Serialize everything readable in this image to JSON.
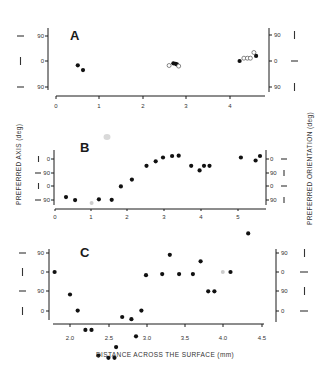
{
  "figure": {
    "y_axis_title_left": "PREFERRED AXIS (deg)",
    "y_axis_title_right": "PREFERRED ORIENTATION (deg)",
    "x_axis_title": "DISTANCE ACROSS THE SURFACE (mm)"
  },
  "chart_data": [
    {
      "panel": "A",
      "type": "scatter",
      "title": "A",
      "xlabel": "",
      "ylabel": "PREFERRED AXIS (deg)",
      "ylabel_right": "PREFERRED ORIENTATION (deg)",
      "x_ticks": [
        "0",
        "1",
        "2",
        "3",
        "4"
      ],
      "y_ticks_left": [
        "90",
        "0",
        "90"
      ],
      "y_ticks_right": [
        "90",
        "0",
        "90"
      ],
      "xlim": [
        -0.2,
        4.9
      ],
      "ylim": [
        -110,
        110
      ],
      "grid": false,
      "series": [
        {
          "name": "filled",
          "marker": "filled-circle",
          "x": [
            0.5,
            0.62,
            2.7,
            2.75,
            2.78,
            4.22,
            4.6
          ],
          "y": [
            -15,
            -32,
            -8,
            -10,
            -12,
            0,
            18
          ]
        },
        {
          "name": "open",
          "marker": "open-circle",
          "x": [
            2.6,
            2.82,
            4.32,
            4.4,
            4.47,
            4.55
          ],
          "y": [
            -16,
            -18,
            10,
            10,
            10,
            30
          ]
        }
      ]
    },
    {
      "panel": "B",
      "type": "scatter",
      "title": "B",
      "xlabel": "",
      "ylabel": "PREFERRED AXIS (deg)",
      "ylabel_right": "PREFERRED ORIENTATION (deg)",
      "x_ticks": [
        "0",
        "1",
        "2",
        "3",
        "4",
        "5"
      ],
      "y_ticks_left": [
        "0",
        "90",
        "0",
        "90"
      ],
      "y_ticks_right": [
        "0",
        "90",
        "0",
        "90"
      ],
      "y_note": "Alternating 0/90 tick labels; values plotted as cumulative angle (deg) increasing upward",
      "xlim": [
        0,
        5.7
      ],
      "ylim": [
        -310,
        40
      ],
      "grid": false,
      "series": [
        {
          "name": "filled",
          "marker": "filled-circle",
          "x": [
            0.3,
            0.55,
            1.2,
            1.55,
            1.8,
            2.1,
            2.5,
            2.75,
            2.95,
            3.2,
            3.38,
            3.72,
            3.95,
            4.07,
            4.22,
            5.08,
            5.48,
            5.6
          ],
          "y": [
            -250,
            -270,
            -265,
            -268,
            -180,
            -135,
            -45,
            -15,
            10,
            20,
            22,
            -45,
            -75,
            -45,
            -45,
            10,
            -10,
            20
          ]
        },
        {
          "name": "grey",
          "marker": "grey-circle",
          "x": [
            1.0
          ],
          "y": [
            -290
          ]
        }
      ]
    },
    {
      "panel": "C",
      "type": "scatter",
      "title": "C",
      "xlabel": "DISTANCE ACROSS THE SURFACE (mm)",
      "ylabel": "PREFERRED AXIS (deg)",
      "ylabel_right": "PREFERRED ORIENTATION (deg)",
      "x_ticks": [
        "2.0",
        "2.5",
        "3.0",
        "3.5",
        "4.0",
        "4.5"
      ],
      "y_ticks_left": [
        "90",
        "0",
        "90",
        "0"
      ],
      "y_ticks_right": [
        "90",
        "0",
        "90",
        "0"
      ],
      "y_note": "Alternating 90/0 tick labels; values plotted as cumulative angle (deg) decreasing downward",
      "xlim": [
        1.75,
        4.55
      ],
      "ylim": [
        -330,
        110
      ],
      "grid": false,
      "series": [
        {
          "name": "filled",
          "marker": "filled-circle",
          "x": [
            1.8,
            2.0,
            2.1,
            2.2,
            2.28,
            2.37,
            2.5,
            2.58,
            2.6,
            2.68,
            2.8,
            2.86,
            2.93,
            2.99,
            3.2,
            3.3,
            3.42,
            3.6,
            3.7,
            3.8,
            3.88,
            4.09,
            4.32
          ],
          "y": [
            0,
            -105,
            -180,
            -270,
            -270,
            -390,
            -400,
            -400,
            -350,
            -210,
            -220,
            -300,
            -180,
            -15,
            -10,
            80,
            -10,
            -10,
            50,
            -90,
            -90,
            0,
            180
          ]
        },
        {
          "name": "grey",
          "marker": "grey-circle",
          "x": [
            3.99
          ],
          "y": [
            0
          ]
        }
      ]
    }
  ]
}
